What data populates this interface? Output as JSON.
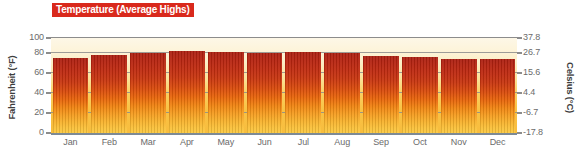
{
  "chart_data": {
    "type": "bar",
    "title": "Temperature (Average Highs)",
    "xlabel": "",
    "ylabel": "Fahrenheit (°F)",
    "ylabel_right": "Celsius (°C)",
    "categories": [
      "Jan",
      "Feb",
      "Mar",
      "Apr",
      "May",
      "Jun",
      "Jul",
      "Aug",
      "Sep",
      "Oct",
      "Nov",
      "Dec"
    ],
    "values": [
      79,
      82,
      84,
      86,
      85,
      84,
      85,
      84,
      81,
      80,
      78,
      78
    ],
    "unit": "°F",
    "ylim": [
      0,
      100
    ],
    "ylim_right": [
      -17.8,
      37.8
    ],
    "yticks": [
      0,
      20,
      40,
      60,
      80,
      100
    ],
    "ytick_labels": [
      "0",
      "20",
      "40",
      "60",
      "80",
      "100"
    ],
    "yticks_right": [
      -17.8,
      -6.7,
      4.4,
      15.6,
      26.7,
      37.8
    ],
    "ytick_labels_right": [
      "-17.8",
      "-6.7",
      "4.4",
      "15.6",
      "26.7",
      "37.8"
    ],
    "grid": true,
    "legend": "none",
    "series_name": "Average Highs"
  },
  "title_badge": {
    "text": "Temperature (Average Highs)",
    "background_color": "#d9291c",
    "text_color": "#ffffff"
  },
  "axes": {
    "left_title": "Fahrenheit (°F)",
    "right_title": "Celsius (°C)",
    "left_ticks": [
      "100",
      "80",
      "60",
      "40",
      "20",
      "0"
    ],
    "right_ticks": [
      "37.8",
      "26.7",
      "15.6",
      "4.4",
      "-6.7",
      "-17.8"
    ],
    "gridline_color": "#8c8c8c",
    "baseline_color": "#7d8a95",
    "tick_text_color": "#6b6b6b"
  },
  "months": [
    "Jan",
    "Feb",
    "Mar",
    "Apr",
    "May",
    "Jun",
    "Jul",
    "Aug",
    "Sep",
    "Oct",
    "Nov",
    "Dec"
  ],
  "colors": {
    "bar_top": "#ab1f11",
    "bar_mid": "#e8650a",
    "bar_bottom": "#fbc941",
    "plot_bg_top": "#fdf7e7",
    "plot_bg_bottom": "#f8bd3e",
    "accent": "#d9291c"
  }
}
